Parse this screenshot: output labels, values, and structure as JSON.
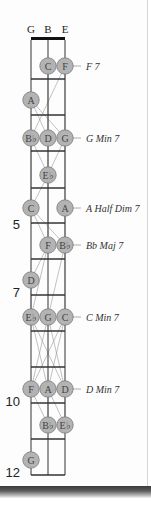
{
  "diagram": {
    "type": "fretboard-chord-chart",
    "strings": [
      {
        "label": "G",
        "x": 31
      },
      {
        "label": "B",
        "x": 48
      },
      {
        "label": "E",
        "x": 65
      }
    ],
    "nut_y": 40,
    "fret_ys": [
      79,
      115,
      151,
      188,
      223,
      259,
      295,
      331,
      367,
      403,
      439,
      475
    ],
    "fret_numbers": [
      {
        "label": "5",
        "y": 229
      },
      {
        "label": "7",
        "y": 297
      },
      {
        "label": "10",
        "y": 406
      },
      {
        "label": "12",
        "y": 477
      }
    ],
    "colors": {
      "dot_fill": "#b3b3b3",
      "dot_stroke": "#7a7a7a",
      "line": "#333333",
      "leader": "#999999"
    },
    "chords": [
      {
        "name": "F 7",
        "y": 66,
        "notes": [
          {
            "note": "C",
            "x": 48
          },
          {
            "note": "F",
            "x": 65
          }
        ]
      },
      {
        "name": "",
        "y": 100,
        "notes": [
          {
            "note": "A",
            "x": 31
          }
        ]
      },
      {
        "name": "G Min 7",
        "y": 138,
        "notes": [
          {
            "note": "B♭",
            "x": 31
          },
          {
            "note": "D",
            "x": 48
          },
          {
            "note": "G",
            "x": 65
          }
        ]
      },
      {
        "name": "",
        "y": 175,
        "notes": [
          {
            "note": "E♭",
            "x": 48
          }
        ]
      },
      {
        "name": "A Half Dim 7",
        "y": 208,
        "notes": [
          {
            "note": "C",
            "x": 31
          },
          {
            "note": "A",
            "x": 65
          }
        ]
      },
      {
        "name": "Bb Maj 7",
        "y": 245,
        "notes": [
          {
            "note": "F",
            "x": 48
          },
          {
            "note": "B♭",
            "x": 65
          }
        ]
      },
      {
        "name": "",
        "y": 280,
        "notes": [
          {
            "note": "D",
            "x": 31
          }
        ]
      },
      {
        "name": "C Min 7",
        "y": 317,
        "notes": [
          {
            "note": "E♭",
            "x": 31
          },
          {
            "note": "G",
            "x": 48
          },
          {
            "note": "C",
            "x": 65
          }
        ]
      },
      {
        "name": "D Min 7",
        "y": 389,
        "notes": [
          {
            "note": "F",
            "x": 31
          },
          {
            "note": "A",
            "x": 48
          },
          {
            "note": "D",
            "x": 65
          }
        ]
      },
      {
        "name": "",
        "y": 425,
        "notes": [
          {
            "note": "B♭",
            "x": 48
          },
          {
            "note": "E♭",
            "x": 65
          }
        ]
      },
      {
        "name": "",
        "y": 460,
        "notes": [
          {
            "note": "G",
            "x": 31
          }
        ]
      }
    ],
    "voice_leading_lines": [
      [
        31,
        100,
        48,
        138
      ],
      [
        31,
        100,
        65,
        138
      ],
      [
        48,
        66,
        48,
        138
      ],
      [
        65,
        66,
        65,
        138
      ],
      [
        65,
        66,
        31,
        138
      ],
      [
        31,
        138,
        48,
        175
      ],
      [
        48,
        138,
        48,
        175
      ],
      [
        65,
        138,
        48,
        175
      ],
      [
        31,
        138,
        31,
        208
      ],
      [
        65,
        138,
        65,
        208
      ],
      [
        31,
        208,
        48,
        245
      ],
      [
        65,
        208,
        65,
        245
      ],
      [
        31,
        208,
        65,
        245
      ],
      [
        48,
        175,
        48,
        245
      ],
      [
        48,
        175,
        31,
        208
      ],
      [
        48,
        245,
        31,
        280
      ],
      [
        65,
        245,
        48,
        317
      ],
      [
        48,
        245,
        31,
        317
      ],
      [
        65,
        245,
        65,
        317
      ],
      [
        31,
        280,
        31,
        317
      ],
      [
        31,
        317,
        48,
        389
      ],
      [
        48,
        317,
        31,
        389
      ],
      [
        48,
        317,
        65,
        389
      ],
      [
        65,
        317,
        48,
        389
      ],
      [
        31,
        317,
        65,
        389
      ],
      [
        65,
        317,
        31,
        389
      ],
      [
        48,
        389,
        48,
        425
      ],
      [
        31,
        389,
        48,
        425
      ],
      [
        65,
        389,
        65,
        425
      ],
      [
        48,
        389,
        65,
        425
      ]
    ]
  }
}
